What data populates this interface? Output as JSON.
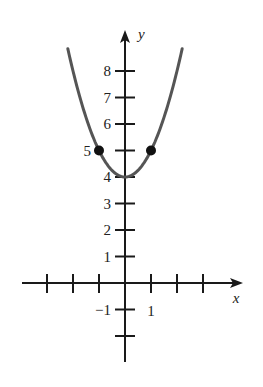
{
  "chart_data": {
    "type": "line",
    "title": "",
    "function": "y = x^2 + 4",
    "xlabel": "x",
    "ylabel": "y",
    "xlim": [
      -4,
      4.5
    ],
    "ylim": [
      -3,
      9.8
    ],
    "grid": false,
    "x_ticks": [
      -3,
      -2,
      -1,
      1,
      2,
      3
    ],
    "x_tick_labels": [
      {
        "value": 1,
        "label": "1"
      }
    ],
    "y_ticks": [
      -2,
      -1,
      1,
      2,
      3,
      4,
      5,
      6,
      7,
      8
    ],
    "y_tick_labels": [
      {
        "value": -1,
        "label": "−1"
      },
      {
        "value": 1,
        "label": "1"
      },
      {
        "value": 2,
        "label": "2"
      },
      {
        "value": 3,
        "label": "3"
      },
      {
        "value": 4,
        "label": "4"
      },
      {
        "value": 5,
        "label": "5"
      },
      {
        "value": 6,
        "label": "6"
      },
      {
        "value": 7,
        "label": "7"
      },
      {
        "value": 8,
        "label": "8"
      }
    ],
    "series": [
      {
        "name": "parabola",
        "x": [
          -2.35,
          -2,
          -1.5,
          -1,
          -0.5,
          0,
          0.5,
          1,
          1.5,
          2,
          2.5
        ],
        "y": [
          9.52,
          8,
          6.25,
          5,
          4.25,
          4,
          4.25,
          5,
          6.25,
          8,
          10.25
        ]
      }
    ],
    "points": [
      {
        "x": -1,
        "y": 5,
        "style": "filled-dot"
      },
      {
        "x": 1,
        "y": 5,
        "style": "filled-dot"
      }
    ],
    "colors": {
      "curve": "#555555",
      "axes": "#1a1a1a",
      "points": "#111111"
    }
  }
}
